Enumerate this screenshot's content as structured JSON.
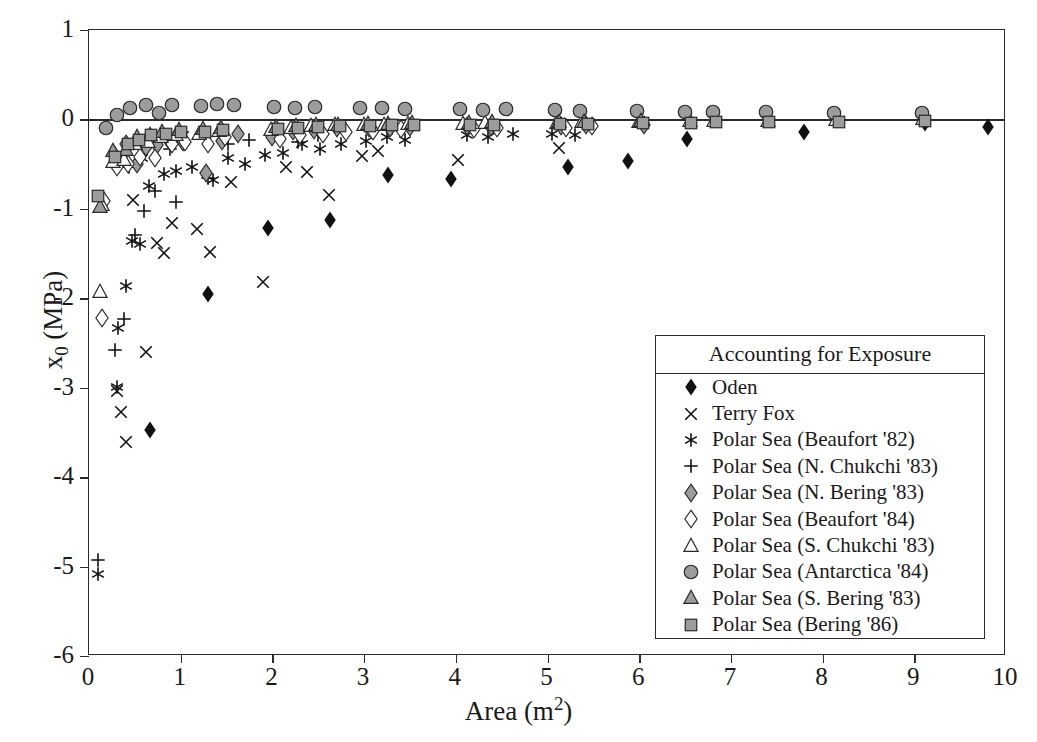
{
  "chart_data": {
    "type": "scatter",
    "title": "",
    "xlabel": "Area (m2)",
    "ylabel": "x0 (MPa)",
    "xlim": [
      0,
      10
    ],
    "ylim": [
      -6,
      1
    ],
    "xticks": [
      0,
      1,
      2,
      3,
      4,
      5,
      6,
      7,
      8,
      9,
      10
    ],
    "yticks": [
      1,
      0,
      -1,
      -2,
      -3,
      -4,
      -5,
      -6
    ],
    "grid": false,
    "legend_position": "lower-right",
    "legend_title": "Accounting for Exposure",
    "series": [
      {
        "name": "Oden",
        "marker": "filled-diamond",
        "color": "#1a1a1a",
        "points": [
          [
            0.66,
            -3.5
          ],
          [
            1.3,
            -1.97
          ],
          [
            1.95,
            -1.24
          ],
          [
            2.63,
            -1.15
          ],
          [
            3.26,
            -0.64
          ],
          [
            3.95,
            -0.69
          ],
          [
            5.22,
            -0.55
          ],
          [
            5.88,
            -0.49
          ],
          [
            6.52,
            -0.24
          ],
          [
            7.8,
            -0.16
          ],
          [
            9.12,
            -0.06
          ],
          [
            9.8,
            -0.11
          ]
        ]
      },
      {
        "name": "Terry Fox",
        "marker": "cross-x",
        "color": "#1a1a1a",
        "points": [
          [
            0.3,
            -3.06
          ],
          [
            0.35,
            -3.29
          ],
          [
            0.4,
            -3.63
          ],
          [
            0.62,
            -2.62
          ],
          [
            0.74,
            -1.4
          ],
          [
            0.82,
            -1.52
          ],
          [
            0.9,
            -1.18
          ],
          [
            1.18,
            -1.25
          ],
          [
            1.32,
            -1.5
          ],
          [
            1.55,
            -0.72
          ],
          [
            1.9,
            -1.84
          ],
          [
            2.15,
            -0.55
          ],
          [
            2.38,
            -0.61
          ],
          [
            2.62,
            -0.87
          ],
          [
            2.98,
            -0.43
          ],
          [
            3.15,
            -0.37
          ],
          [
            4.02,
            -0.48
          ],
          [
            5.12,
            -0.34
          ],
          [
            0.48,
            -0.92
          ],
          [
            1.02,
            -0.22
          ]
        ]
      },
      {
        "name": "Polar Sea (Beaufort '82)",
        "marker": "asterisk",
        "color": "#1a1a1a",
        "points": [
          [
            0.1,
            -5.1
          ],
          [
            0.3,
            -3.01
          ],
          [
            0.32,
            -2.35
          ],
          [
            0.4,
            -1.88
          ],
          [
            0.47,
            -1.38
          ],
          [
            0.56,
            -1.42
          ],
          [
            0.65,
            -0.77
          ],
          [
            0.82,
            -0.63
          ],
          [
            0.95,
            -0.6
          ],
          [
            1.12,
            -0.55
          ],
          [
            1.35,
            -0.7
          ],
          [
            1.52,
            -0.45
          ],
          [
            1.7,
            -0.52
          ],
          [
            1.92,
            -0.42
          ],
          [
            2.12,
            -0.4
          ],
          [
            2.32,
            -0.3
          ],
          [
            2.52,
            -0.35
          ],
          [
            2.75,
            -0.3
          ],
          [
            3.02,
            -0.26
          ],
          [
            3.25,
            -0.22
          ],
          [
            3.45,
            -0.25
          ],
          [
            4.12,
            -0.2
          ],
          [
            4.35,
            -0.22
          ],
          [
            4.62,
            -0.19
          ],
          [
            5.05,
            -0.18
          ],
          [
            5.3,
            -0.2
          ],
          [
            0.58,
            -0.45
          ],
          [
            1.0,
            -0.25
          ]
        ]
      },
      {
        "name": "Polar Sea (N. Chukchi '83)",
        "marker": "plus",
        "color": "#1a1a1a",
        "points": [
          [
            0.1,
            -4.95
          ],
          [
            0.28,
            -2.6
          ],
          [
            0.38,
            -2.25
          ],
          [
            0.5,
            -1.32
          ],
          [
            0.6,
            -1.05
          ],
          [
            0.72,
            -0.82
          ],
          [
            0.95,
            -0.95
          ],
          [
            1.3,
            -0.68
          ],
          [
            1.52,
            -0.3
          ],
          [
            1.75,
            -0.25
          ],
          [
            2.28,
            -0.28
          ],
          [
            2.5,
            -0.2
          ],
          [
            0.44,
            -0.55
          ],
          [
            0.88,
            -0.35
          ]
        ]
      },
      {
        "name": "Polar Sea (N. Bering '83)",
        "marker": "filled-diamond-gray",
        "color": "#9c9c9c",
        "points": [
          [
            0.28,
            -0.43
          ],
          [
            0.4,
            -0.3
          ],
          [
            0.52,
            -0.52
          ],
          [
            0.62,
            -0.33
          ],
          [
            0.74,
            -0.31
          ],
          [
            0.88,
            -0.28
          ],
          [
            1.02,
            -0.27
          ],
          [
            1.28,
            -0.62
          ],
          [
            1.45,
            -0.26
          ],
          [
            1.62,
            -0.18
          ],
          [
            2.0,
            -0.22
          ],
          [
            2.22,
            -0.15
          ],
          [
            2.45,
            -0.14
          ],
          [
            2.7,
            -0.12
          ],
          [
            3.05,
            -0.12
          ],
          [
            3.28,
            -0.12
          ],
          [
            3.5,
            -0.11
          ],
          [
            4.12,
            -0.1
          ],
          [
            4.38,
            -0.11
          ],
          [
            5.15,
            -0.1
          ],
          [
            5.42,
            -0.09
          ],
          [
            6.05,
            -0.08
          ]
        ]
      },
      {
        "name": "Polar Sea (Beaufort '84)",
        "marker": "open-diamond",
        "color": "#1a1a1a",
        "points": [
          [
            0.14,
            -2.24
          ],
          [
            0.16,
            -0.93
          ],
          [
            0.3,
            -0.55
          ],
          [
            0.42,
            -0.52
          ],
          [
            0.56,
            -0.44
          ],
          [
            0.72,
            -0.45
          ],
          [
            0.9,
            -0.3
          ],
          [
            1.05,
            -0.28
          ],
          [
            1.3,
            -0.3
          ],
          [
            1.48,
            -0.22
          ],
          [
            2.08,
            -0.24
          ],
          [
            2.3,
            -0.2
          ],
          [
            2.55,
            -0.18
          ],
          [
            2.8,
            -0.16
          ],
          [
            3.1,
            -0.15
          ],
          [
            3.4,
            -0.13
          ],
          [
            4.2,
            -0.13
          ],
          [
            4.45,
            -0.12
          ],
          [
            5.2,
            -0.12
          ],
          [
            5.48,
            -0.1
          ]
        ]
      },
      {
        "name": "Polar Sea (S. Chukchi '83)",
        "marker": "open-triangle",
        "color": "#1a1a1a",
        "points": [
          [
            0.12,
            -1.95
          ],
          [
            0.14,
            -0.98
          ],
          [
            0.26,
            -0.5
          ],
          [
            0.38,
            -0.48
          ],
          [
            0.5,
            -0.3
          ],
          [
            0.64,
            -0.28
          ],
          [
            0.78,
            -0.22
          ],
          [
            0.95,
            -0.2
          ],
          [
            1.2,
            -0.18
          ],
          [
            1.42,
            -0.15
          ],
          [
            1.98,
            -0.14
          ],
          [
            2.2,
            -0.12
          ],
          [
            2.42,
            -0.1
          ],
          [
            2.68,
            -0.09
          ],
          [
            3.0,
            -0.08
          ],
          [
            3.22,
            -0.08
          ],
          [
            3.48,
            -0.07
          ],
          [
            4.08,
            -0.07
          ],
          [
            4.32,
            -0.06
          ],
          [
            5.1,
            -0.06
          ],
          [
            5.38,
            -0.05
          ],
          [
            6.0,
            -0.05
          ],
          [
            6.55,
            -0.04
          ],
          [
            6.82,
            -0.04
          ],
          [
            7.4,
            -0.04
          ],
          [
            8.15,
            -0.03
          ],
          [
            9.1,
            -0.02
          ]
        ]
      },
      {
        "name": "Polar Sea (Antarctica '84)",
        "marker": "filled-circle-gray",
        "color": "#9c9c9c",
        "points": [
          [
            0.18,
            -0.12
          ],
          [
            0.3,
            0.03
          ],
          [
            0.45,
            0.1
          ],
          [
            0.62,
            0.14
          ],
          [
            0.76,
            0.05
          ],
          [
            0.9,
            0.14
          ],
          [
            1.22,
            0.13
          ],
          [
            1.4,
            0.15
          ],
          [
            1.58,
            0.14
          ],
          [
            2.02,
            0.12
          ],
          [
            2.25,
            0.11
          ],
          [
            2.46,
            0.12
          ],
          [
            2.95,
            0.1
          ],
          [
            3.2,
            0.11
          ],
          [
            3.45,
            0.09
          ],
          [
            4.05,
            0.09
          ],
          [
            4.3,
            0.08
          ],
          [
            4.55,
            0.09
          ],
          [
            5.08,
            0.08
          ],
          [
            5.35,
            0.07
          ],
          [
            5.98,
            0.07
          ],
          [
            6.5,
            0.06
          ],
          [
            6.8,
            0.06
          ],
          [
            7.38,
            0.06
          ],
          [
            8.12,
            0.05
          ],
          [
            9.08,
            0.05
          ]
        ]
      },
      {
        "name": "Polar Sea (S. Bering '83)",
        "marker": "filled-triangle-gray",
        "color": "#9c9c9c",
        "points": [
          [
            0.12,
            -1.0
          ],
          [
            0.26,
            -0.38
          ],
          [
            0.4,
            -0.36
          ],
          [
            0.52,
            -0.22
          ],
          [
            0.66,
            -0.2
          ],
          [
            0.8,
            -0.16
          ],
          [
            0.98,
            -0.14
          ],
          [
            1.24,
            -0.13
          ],
          [
            1.44,
            -0.12
          ],
          [
            2.04,
            -0.11
          ],
          [
            2.26,
            -0.1
          ],
          [
            2.48,
            -0.09
          ],
          [
            2.72,
            -0.08
          ],
          [
            3.04,
            -0.07
          ],
          [
            3.26,
            -0.07
          ],
          [
            3.52,
            -0.06
          ],
          [
            4.14,
            -0.06
          ],
          [
            4.4,
            -0.05
          ],
          [
            5.12,
            -0.05
          ],
          [
            5.4,
            -0.05
          ],
          [
            6.02,
            -0.04
          ]
        ]
      },
      {
        "name": "Polar Sea (Bering '86)",
        "marker": "filled-square-gray",
        "color": "#9c9c9c",
        "points": [
          [
            0.1,
            -0.88
          ],
          [
            0.28,
            -0.44
          ],
          [
            0.42,
            -0.3
          ],
          [
            0.55,
            -0.25
          ],
          [
            0.68,
            -0.2
          ],
          [
            0.84,
            -0.18
          ],
          [
            1.0,
            -0.16
          ],
          [
            1.26,
            -0.16
          ],
          [
            1.46,
            -0.14
          ],
          [
            2.06,
            -0.13
          ],
          [
            2.28,
            -0.12
          ],
          [
            2.5,
            -0.11
          ],
          [
            2.74,
            -0.1
          ],
          [
            3.06,
            -0.1
          ],
          [
            3.3,
            -0.09
          ],
          [
            3.54,
            -0.09
          ],
          [
            4.16,
            -0.08
          ],
          [
            4.42,
            -0.08
          ],
          [
            5.14,
            -0.07
          ],
          [
            5.44,
            -0.07
          ],
          [
            6.04,
            -0.06
          ],
          [
            6.56,
            -0.06
          ],
          [
            6.84,
            -0.05
          ],
          [
            7.42,
            -0.05
          ],
          [
            8.18,
            -0.05
          ],
          [
            9.12,
            -0.04
          ]
        ]
      }
    ]
  },
  "axes": {
    "x_label_text": "Area (m",
    "x_label_sup": "2",
    "x_label_close": ")",
    "y_label_text": "x",
    "y_label_sub": "0",
    "y_label_unit": " (MPa)"
  },
  "legend": {
    "title": "Accounting for Exposure",
    "entries": [
      {
        "label": "Oden",
        "marker": "filled-diamond"
      },
      {
        "label": "Terry Fox",
        "marker": "cross-x"
      },
      {
        "label": "Polar Sea (Beaufort '82)",
        "marker": "asterisk"
      },
      {
        "label": "Polar Sea (N. Chukchi '83)",
        "marker": "plus"
      },
      {
        "label": "Polar Sea (N. Bering '83)",
        "marker": "filled-diamond-gray"
      },
      {
        "label": "Polar Sea (Beaufort '84)",
        "marker": "open-diamond"
      },
      {
        "label": "Polar Sea (S. Chukchi '83)",
        "marker": "open-triangle"
      },
      {
        "label": "Polar Sea (Antarctica '84)",
        "marker": "filled-circle-gray"
      },
      {
        "label": "Polar Sea (S. Bering '83)",
        "marker": "filled-triangle-gray"
      },
      {
        "label": "Polar Sea (Bering '86)",
        "marker": "filled-square-gray"
      }
    ]
  }
}
